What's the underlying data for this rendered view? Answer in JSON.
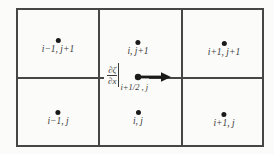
{
  "colors": {
    "background": "#fbfbf9",
    "line": "#464646",
    "dot": "#1a1a1a",
    "text": "#3a3a3a"
  },
  "nodes": [
    {
      "id": "top-left",
      "label": "i−1, j+1"
    },
    {
      "id": "top-center",
      "label": "i, j+1"
    },
    {
      "id": "top-right",
      "label": "i+1, j+1"
    },
    {
      "id": "bottom-left",
      "label": "i−1, j"
    },
    {
      "id": "bottom-center",
      "label": "i, j"
    },
    {
      "id": "bottom-right",
      "label": "i+1, j"
    }
  ],
  "formula": {
    "numerator": "∂ζ",
    "denominator": "∂x",
    "subscript": "i+1/2 , j"
  },
  "arrow": {
    "direction": "right"
  }
}
